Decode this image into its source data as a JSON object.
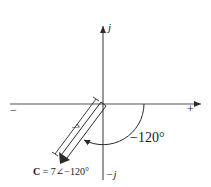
{
  "diagram": {
    "type": "phasor-diagram",
    "axes": {
      "imag_positive_label": "j",
      "imag_negative_label": "−j",
      "real_negative_label": "−",
      "real_positive_label": "+"
    },
    "phasor": {
      "name": "C",
      "magnitude": 7,
      "angle_deg": -120,
      "magnitude_label": "7",
      "angle_label": "−120°",
      "caption_symbol": "C",
      "caption_rest": " = 7∠−120°"
    },
    "colors": {
      "line": "#2a2a2a",
      "background": "#ffffff"
    }
  }
}
